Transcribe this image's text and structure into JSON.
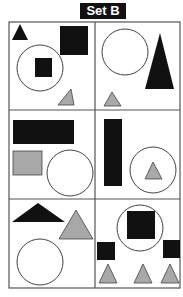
{
  "title": "Set B",
  "colors": {
    "black": "#111111",
    "gray": "#a8a8a8",
    "outline": "#444444",
    "background": "#ffffff"
  },
  "grid": {
    "rows": 3,
    "columns": 2
  },
  "cells": [
    {
      "id": "cell-1",
      "shapes": [
        "small black triangle",
        "large black square",
        "circle containing black square",
        "gray triangle"
      ]
    },
    {
      "id": "cell-2",
      "shapes": [
        "circle",
        "tall black triangle",
        "gray triangle"
      ]
    },
    {
      "id": "cell-3",
      "shapes": [
        "black rectangle",
        "gray rectangle",
        "circle"
      ]
    },
    {
      "id": "cell-4",
      "shapes": [
        "tall black rectangle",
        "circle containing gray triangle"
      ]
    },
    {
      "id": "cell-5",
      "shapes": [
        "flat black triangle",
        "gray triangle",
        "circle"
      ]
    },
    {
      "id": "cell-6",
      "shapes": [
        "circle containing black square",
        "two black squares",
        "three gray triangles"
      ]
    }
  ]
}
